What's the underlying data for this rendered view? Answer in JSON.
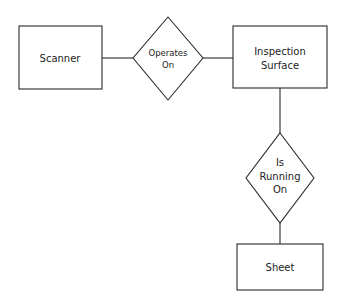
{
  "diagram": {
    "type": "entity-relationship",
    "entities": [
      {
        "id": "scanner",
        "label": "Scanner",
        "x": 19,
        "y": 26,
        "w": 83,
        "h": 63
      },
      {
        "id": "inspection_surface",
        "label_line1": "Inspection",
        "label_line2": "Surface",
        "x": 233,
        "y": 26,
        "w": 94,
        "h": 62
      },
      {
        "id": "sheet",
        "label": "Sheet",
        "x": 237,
        "y": 244,
        "w": 86,
        "h": 46
      }
    ],
    "relationships": [
      {
        "id": "operates_on",
        "label_line1": "Operates",
        "label_line2": "On",
        "cx": 168,
        "cy": 58,
        "rx": 35,
        "ry": 41
      },
      {
        "id": "is_running_on",
        "label_line1": "Is",
        "label_line2": "Running",
        "label_line3": "On",
        "cx": 280,
        "cy": 178,
        "rx": 34,
        "ry": 45
      }
    ],
    "edges": [
      {
        "from": "scanner",
        "to": "operates_on"
      },
      {
        "from": "operates_on",
        "to": "inspection_surface"
      },
      {
        "from": "inspection_surface",
        "to": "is_running_on"
      },
      {
        "from": "is_running_on",
        "to": "sheet"
      }
    ],
    "colors": {
      "stroke": "#2a2a2a",
      "text": "#222222",
      "background": "#ffffff"
    }
  }
}
